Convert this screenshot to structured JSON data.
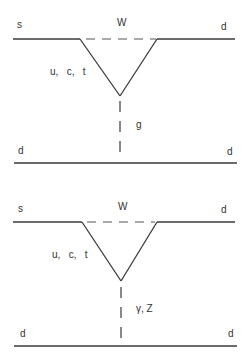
{
  "diagrams": [
    {
      "id": "top",
      "labels": {
        "s": "s",
        "w": "W",
        "d_top_right": "d",
        "quarks": "u,   c,   t",
        "boson": "g",
        "d_bottom_left": "d",
        "d_bottom_right": "d"
      }
    },
    {
      "id": "bottom",
      "labels": {
        "s": "s",
        "w": "W",
        "d_top_right": "d",
        "quarks": "u,   c,   t",
        "boson": "γ, Z",
        "d_bottom_left": "d",
        "d_bottom_right": "d"
      }
    }
  ],
  "colors": {
    "line": "#3a3a3a",
    "text": "#333333",
    "background": "#ffffff"
  }
}
